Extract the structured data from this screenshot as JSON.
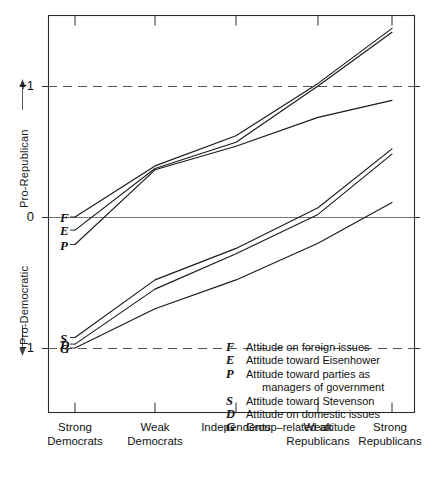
{
  "axes": {
    "y_upper_title": "Pro-Republican",
    "y_lower_title": "Pro-Democratic",
    "y_ticks": [
      "+1",
      "0",
      "−1"
    ],
    "x_ticks": [
      "Strong\nDemocrats",
      "Weak\nDemocrats",
      "Independents",
      "Weak\nRepublicans",
      "Strong\nRepublicans"
    ]
  },
  "series_keys": {
    "F": "F",
    "E": "E",
    "P": "P",
    "S": "S",
    "D": "D",
    "G": "G"
  },
  "legend": [
    {
      "symbol": "F",
      "text": "Attitude on foreign issues",
      "cont": ""
    },
    {
      "symbol": "E",
      "text": "Attitude toward Eisenhower",
      "cont": ""
    },
    {
      "symbol": "P",
      "text": "Attitude toward parties as",
      "cont": "managers of government"
    },
    {
      "symbol": "S",
      "text": "Attitude toward Stevenson",
      "cont": ""
    },
    {
      "symbol": "D",
      "text": "Attitude on domestic issues",
      "cont": ""
    },
    {
      "symbol": "G",
      "text": "Group–related attitude",
      "cont": ""
    }
  ],
  "chart_data": {
    "type": "line",
    "title": "",
    "xlabel": "",
    "ylabel": "Pro-Republican / Pro-Democratic",
    "ylim": [
      -1.3,
      1.6
    ],
    "grid": false,
    "legend_position": "inside-bottom-right",
    "reference_lines": [
      {
        "value": 1,
        "style": "dashed"
      },
      {
        "value": 0,
        "style": "solid"
      },
      {
        "value": -1,
        "style": "dashed"
      }
    ],
    "categories": [
      "Strong Democrats",
      "Weak Democrats",
      "Independents",
      "Weak Republicans",
      "Strong Republicans"
    ],
    "series": [
      {
        "name": "F",
        "label": "Attitude on foreign issues",
        "values": [
          0.0,
          0.39,
          0.62,
          1.02,
          1.44
        ]
      },
      {
        "name": "E",
        "label": "Attitude toward Eisenhower",
        "values": [
          -0.1,
          0.37,
          0.57,
          1.0,
          1.41
        ]
      },
      {
        "name": "P",
        "label": "Attitude toward parties as managers of government",
        "values": [
          -0.21,
          0.36,
          0.54,
          0.76,
          0.89
        ]
      },
      {
        "name": "S",
        "label": "Attitude toward Stevenson",
        "values": [
          -0.92,
          -0.48,
          -0.24,
          0.07,
          0.52
        ]
      },
      {
        "name": "D",
        "label": "Attitude on domestic issues",
        "values": [
          -0.97,
          -0.55,
          -0.28,
          0.02,
          0.48
        ]
      },
      {
        "name": "G",
        "label": "Group-related attitude",
        "values": [
          -1.0,
          -0.7,
          -0.48,
          -0.2,
          0.11
        ]
      }
    ]
  },
  "geometry": {
    "plot_left": 48,
    "plot_right": 415,
    "plot_top": 15,
    "plot_bottom": 413,
    "y_zero_px": 217,
    "y_unit_px": 131,
    "x_positions": [
      75,
      155,
      236,
      318,
      392
    ]
  }
}
